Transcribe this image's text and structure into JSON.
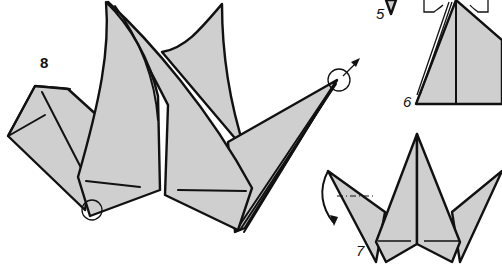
{
  "diagram": {
    "colors": {
      "paper": "#cfcfcf",
      "outline": "#111111",
      "background": "#ffffff"
    },
    "steps": [
      {
        "id": "step-5",
        "label": "5"
      },
      {
        "id": "step-6",
        "label": "6"
      },
      {
        "id": "step-7",
        "label": "7"
      },
      {
        "id": "step-8",
        "label": "8"
      }
    ],
    "annotations": [
      {
        "step": "8",
        "type": "circle-marker",
        "note": "neck tip circled with pull arrow"
      },
      {
        "step": "8",
        "type": "circle-marker",
        "note": "bottom point circled"
      },
      {
        "step": "7",
        "type": "curved-arrow",
        "note": "valley/reverse fold on left wing tip"
      },
      {
        "step": "7",
        "type": "dash-dot-line",
        "note": "fold line on left wing"
      }
    ]
  }
}
